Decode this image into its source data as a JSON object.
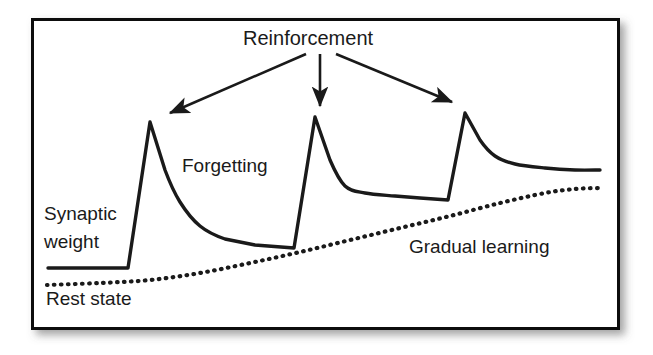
{
  "figure": {
    "type": "line-diagram",
    "background_color": "#ffffff",
    "frame": {
      "border_color": "#111111",
      "border_width_px": 3,
      "x": 31,
      "y": 18,
      "width": 589,
      "height": 312,
      "shadow": true
    },
    "stroke_color": "#1a1a1a",
    "labels": {
      "reinforcement": "Reinforcement",
      "forgetting": "Forgetting",
      "synaptic_line1": "Synaptic",
      "synaptic_line2": "weight",
      "gradual_learning": "Gradual learning",
      "rest_state": "Rest state"
    },
    "arrows": [
      {
        "name": "arrow-to-peak-1",
        "x1": 306,
        "y1": 54,
        "x2": 170,
        "y2": 113
      },
      {
        "name": "arrow-to-peak-2",
        "x1": 320,
        "y1": 54,
        "x2": 320,
        "y2": 106
      },
      {
        "name": "arrow-to-peak-3",
        "x1": 336,
        "y1": 54,
        "x2": 452,
        "y2": 102
      }
    ]
  },
  "chart_data": {
    "type": "line",
    "xlabel": "",
    "ylabel": "Synaptic weight",
    "grid": false,
    "legend": "none",
    "annotations": [
      {
        "text": "Reinforcement",
        "x": 330,
        "y": 40
      },
      {
        "text": "Forgetting",
        "x": 234,
        "y": 167
      },
      {
        "text": "Synaptic weight",
        "x": 90,
        "y": 230
      },
      {
        "text": "Gradual learning",
        "x": 497,
        "y": 248
      },
      {
        "text": "Rest state",
        "x": 96,
        "y": 300
      }
    ],
    "series": [
      {
        "name": "Synaptic weight",
        "style": "solid",
        "description": "Flat baseline, then three reinforcement spikes each followed by exponential forgetting decay; troughs rise progressively indicating gradual learning.",
        "points": [
          [
            48,
            268
          ],
          [
            128,
            268
          ],
          [
            150,
            122
          ],
          [
            165,
            170
          ],
          [
            180,
            202
          ],
          [
            200,
            226
          ],
          [
            225,
            239
          ],
          [
            255,
            245
          ],
          [
            294,
            248
          ],
          [
            315,
            117
          ],
          [
            330,
            160
          ],
          [
            345,
            186
          ],
          [
            365,
            193
          ],
          [
            395,
            196
          ],
          [
            420,
            198
          ],
          [
            448,
            200
          ],
          [
            465,
            113
          ],
          [
            480,
            140
          ],
          [
            495,
            156
          ],
          [
            515,
            164
          ],
          [
            545,
            168
          ],
          [
            575,
            170
          ],
          [
            600,
            170
          ]
        ]
      },
      {
        "name": "Rest state / gradual learning baseline",
        "style": "dotted",
        "description": "Slowly rising dotted baseline representing gradual learning above the rest state.",
        "points": [
          [
            47,
            285
          ],
          [
            100,
            283
          ],
          [
            150,
            280
          ],
          [
            200,
            273
          ],
          [
            250,
            263
          ],
          [
            300,
            252
          ],
          [
            350,
            240
          ],
          [
            400,
            228
          ],
          [
            450,
            216
          ],
          [
            500,
            203
          ],
          [
            545,
            193
          ],
          [
            575,
            189
          ],
          [
            600,
            188
          ]
        ]
      }
    ],
    "peaks": [
      {
        "index": 1,
        "x": 150,
        "y": 122
      },
      {
        "index": 2,
        "x": 315,
        "y": 117
      },
      {
        "index": 3,
        "x": 465,
        "y": 113
      }
    ],
    "troughs": [
      {
        "index": 1,
        "x": 294,
        "y": 248
      },
      {
        "index": 2,
        "x": 448,
        "y": 200
      }
    ]
  }
}
